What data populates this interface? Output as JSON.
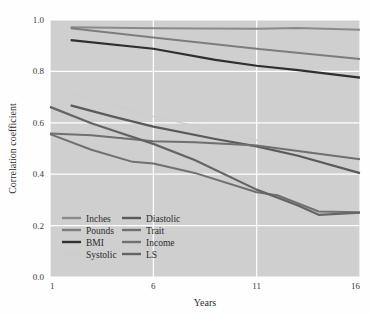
{
  "chart_data": {
    "type": "line",
    "title": "",
    "xlabel": "Years",
    "ylabel": "Correlation coefficient",
    "xlim": [
      1,
      16
    ],
    "ylim": [
      0.0,
      1.0
    ],
    "xticks": [
      "1",
      "6",
      "11",
      "16"
    ],
    "xtick_values": [
      1,
      6,
      11,
      16
    ],
    "yticks": [
      "0.0",
      "0.2",
      "0.4",
      "0.6",
      "0.8",
      "1.0"
    ],
    "ytick_values": [
      0.0,
      0.2,
      0.4,
      0.6,
      0.8,
      1.0
    ],
    "grid": true,
    "grid_color": "#ffffff",
    "plot_background": "#cfcfcf",
    "legend_position": "lower-left-inside",
    "legend_columns": 2,
    "series": [
      {
        "name": "Inches",
        "color": "#8a8a8a",
        "width": 2.0,
        "x": [
          2,
          6,
          11,
          13,
          16
        ],
        "values": [
          0.972,
          0.968,
          0.966,
          0.969,
          0.962
        ]
      },
      {
        "name": "Pounds",
        "color": "#7d7d7d",
        "width": 2.0,
        "x": [
          2,
          6,
          11,
          16
        ],
        "values": [
          0.968,
          0.932,
          0.888,
          0.848
        ]
      },
      {
        "name": "BMI",
        "color": "#2f2f2f",
        "width": 2.2,
        "x": [
          2,
          6,
          9,
          11,
          13,
          16
        ],
        "values": [
          0.922,
          0.888,
          0.845,
          0.822,
          0.805,
          0.776
        ]
      },
      {
        "name": "Systolic",
        "color": "#cdcdcd",
        "width": 1.3,
        "x": [
          2,
          6,
          11,
          14,
          16
        ],
        "values": [
          0.715,
          0.625,
          0.533,
          0.481,
          0.462
        ]
      },
      {
        "name": "Diastolic",
        "color": "#5a5a5a",
        "width": 2.2,
        "x": [
          2,
          4,
          6,
          9,
          11,
          13,
          16
        ],
        "values": [
          0.668,
          0.625,
          0.585,
          0.537,
          0.508,
          0.472,
          0.404
        ]
      },
      {
        "name": "Trait",
        "color": "#6f6f6f",
        "width": 2.0,
        "x": [
          1,
          3,
          6,
          8,
          11,
          13,
          16
        ],
        "values": [
          0.558,
          0.552,
          0.528,
          0.524,
          0.512,
          0.49,
          0.458
        ]
      },
      {
        "name": "Income",
        "color": "#707070",
        "width": 2.0,
        "x": [
          1,
          3,
          5,
          6,
          8,
          11,
          12,
          14,
          16
        ],
        "values": [
          0.556,
          0.495,
          0.448,
          0.442,
          0.405,
          0.33,
          0.318,
          0.255,
          0.252
        ]
      },
      {
        "name": "LS",
        "color": "#646464",
        "width": 2.2,
        "x": [
          1,
          3,
          6,
          8,
          11,
          13,
          14,
          16
        ],
        "values": [
          0.662,
          0.598,
          0.518,
          0.455,
          0.34,
          0.278,
          0.242,
          0.25
        ]
      }
    ],
    "legend_entries": [
      {
        "label": "Inches",
        "color": "#8a8a8a",
        "column": 0,
        "row": 0
      },
      {
        "label": "Pounds",
        "color": "#7d7d7d",
        "column": 0,
        "row": 1
      },
      {
        "label": "BMI",
        "color": "#2f2f2f",
        "column": 0,
        "row": 2
      },
      {
        "label": "Systolic",
        "color": "#cdcdcd",
        "column": 0,
        "row": 3
      },
      {
        "label": "Diastolic",
        "color": "#5a5a5a",
        "column": 1,
        "row": 0
      },
      {
        "label": "Trait",
        "color": "#6f6f6f",
        "column": 1,
        "row": 1
      },
      {
        "label": "Income",
        "color": "#707070",
        "column": 1,
        "row": 2
      },
      {
        "label": "LS",
        "color": "#646464",
        "column": 1,
        "row": 3
      }
    ]
  }
}
